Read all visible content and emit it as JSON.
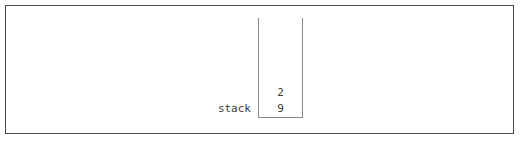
{
  "diagram": {
    "label": "stack",
    "structure_type": "stack",
    "orientation": "vertical",
    "open_side": "top",
    "cells": [
      {
        "value": "2",
        "position": "top"
      },
      {
        "value": "9",
        "position": "bottom"
      }
    ],
    "colors": {
      "frame_border": "#4a4a4a",
      "container_border": "#8a8a8a",
      "text": "#3a3a3a",
      "background": "#ffffff"
    }
  }
}
